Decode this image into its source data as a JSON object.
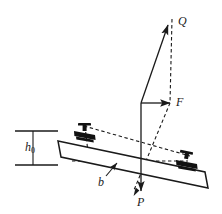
{
  "figure": {
    "background_color": "#ffffff",
    "stroke_color": "#1a1a1a",
    "fill_color": "#111111",
    "labels": {
      "force_q": "Q",
      "force_f": "F",
      "force_p": "P",
      "dimension_b": "b",
      "dimension_h0_base": "h",
      "dimension_h0_sub": "0"
    },
    "vectors": [
      {
        "name": "Q",
        "label": "Q",
        "style": "solid",
        "from": [
          141,
          103
        ],
        "to": [
          169,
          24
        ],
        "arrowhead": "to"
      },
      {
        "name": "F",
        "label": "F",
        "style": "solid",
        "from": [
          141,
          103
        ],
        "to": [
          172,
          103
        ],
        "arrowhead": "to"
      },
      {
        "name": "P",
        "label": "P",
        "style": "solid",
        "from": [
          141,
          103
        ],
        "to": [
          141,
          193
        ],
        "arrowhead": "to"
      }
    ],
    "construction_lines": [
      {
        "name": "q-resultant-dashed",
        "style": "dashed",
        "from": [
          172,
          20
        ],
        "to": [
          170,
          103
        ]
      },
      {
        "name": "p-component-dashed",
        "style": "dashed",
        "from": [
          170,
          103
        ],
        "to": [
          134,
          196
        ]
      },
      {
        "name": "upper-beam-dashed",
        "style": "dashed",
        "from": [
          84,
          127
        ],
        "to": [
          188,
          155
        ]
      },
      {
        "name": "clip-drop-dashed",
        "style": "dashed",
        "from": [
          84,
          127
        ],
        "to": [
          88,
          161
        ]
      },
      {
        "name": "horizontal-base-dashed",
        "style": "dashed",
        "from": [
          73,
          161
        ],
        "to": [
          186,
          161
        ]
      }
    ],
    "dimension_h0": {
      "name": "h0",
      "top_line": {
        "from": [
          15,
          131
        ],
        "to": [
          58,
          131
        ]
      },
      "bottom_line": {
        "from": [
          15,
          165
        ],
        "to": [
          58,
          165
        ]
      },
      "tick_line": {
        "from": [
          33,
          131
        ],
        "to": [
          33,
          165
        ]
      }
    },
    "leader_b": {
      "name": "b-leader",
      "from": [
        106,
        175
      ],
      "to": [
        118,
        162
      ],
      "arrowhead": "to"
    },
    "sleeper": {
      "name": "sleeper-beam",
      "shape": "tilted-rectangle",
      "corners": [
        [
          58,
          141
        ],
        [
          205,
          172
        ],
        [
          208,
          188
        ],
        [
          61,
          157
        ]
      ]
    },
    "fasteners": [
      {
        "name": "rail-fastener-left",
        "position": [
          84,
          134
        ]
      },
      {
        "name": "rail-fastener-right",
        "position": [
          186,
          162
        ]
      }
    ]
  }
}
